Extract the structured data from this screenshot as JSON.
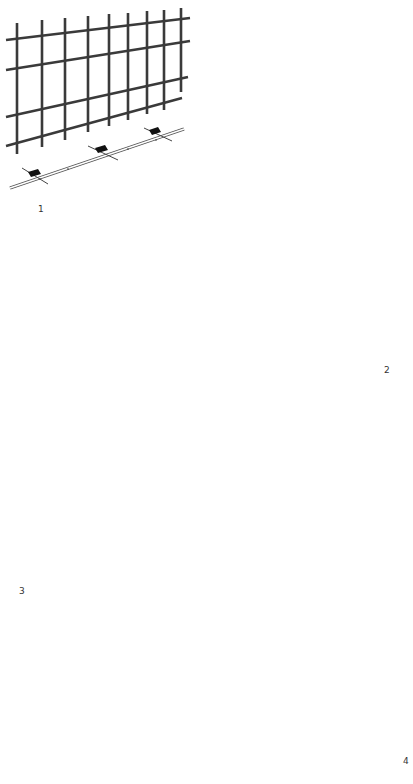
{
  "figures": [
    {
      "id": "1",
      "label": "1",
      "description": "Flat wire mesh panel above base track with three anchor clips"
    },
    {
      "id": "2",
      "label": "2",
      "description": "Corner mesh panels with vertical corner profile, L-shaped base track with clips"
    },
    {
      "id": "3",
      "label": "3",
      "description": "Corner mesh panels meeting at bent corner, L-shaped base track with clips"
    },
    {
      "id": "4",
      "label": "4",
      "description": "Corner mesh panels with stippled infill, base track with clips"
    }
  ],
  "colors": {
    "background": "#ffffff",
    "line": "#3a3a3a",
    "clip": "#111111"
  }
}
